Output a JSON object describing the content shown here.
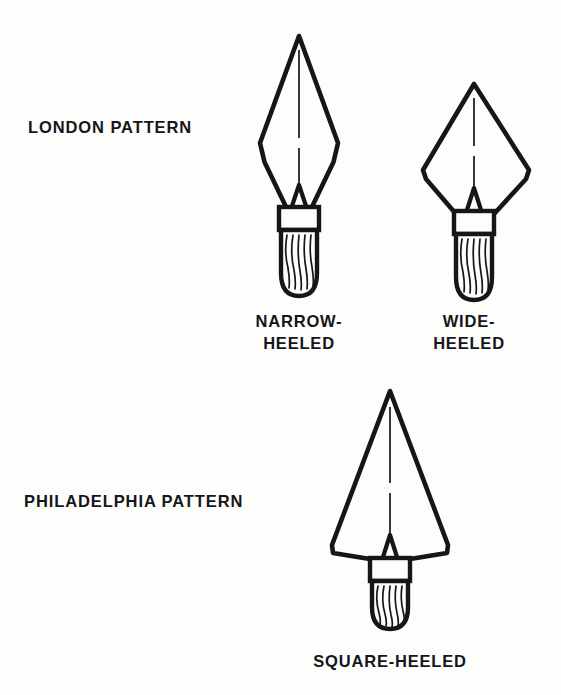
{
  "figure": {
    "background_color": "#fdfdfb",
    "ink_color": "#16161a",
    "width": 561,
    "height": 695
  },
  "groups": [
    {
      "id": "london",
      "label": "LONDON PATTERN"
    },
    {
      "id": "philadelphia",
      "label": "PHILADELPHIA PATTERN"
    }
  ],
  "labels": {
    "london_pattern": "LONDON PATTERN",
    "philadelphia_pattern": "PHILADELPHIA PATTERN"
  },
  "captions": {
    "narrow_heeled_line1": "NARROW-",
    "narrow_heeled_line2": "HEELED",
    "wide_heeled_line1": "WIDE-",
    "wide_heeled_line2": "HEELED",
    "square_heeled": "SQUARE-HEELED"
  },
  "trowels": [
    {
      "id": "narrow-heeled",
      "group": "london",
      "caption": "NARROW-HEELED",
      "blade_shape": "kite",
      "heel": "narrow",
      "widest_point_fraction": 0.58,
      "parts": [
        "blade",
        "center-ridge",
        "tang",
        "ferrule",
        "wood-handle"
      ],
      "handle_grain_lines": 6
    },
    {
      "id": "wide-heeled",
      "group": "london",
      "caption": "WIDE-HEELED",
      "blade_shape": "kite",
      "heel": "wide",
      "widest_point_fraction": 0.68,
      "parts": [
        "blade",
        "center-ridge",
        "tang",
        "ferrule",
        "wood-handle"
      ],
      "handle_grain_lines": 6
    },
    {
      "id": "square-heeled",
      "group": "philadelphia",
      "caption": "SQUARE-HEELED",
      "blade_shape": "triangle",
      "heel": "square",
      "widest_point_fraction": 1.0,
      "parts": [
        "blade",
        "center-ridge",
        "tang",
        "ferrule",
        "wood-handle"
      ],
      "handle_grain_lines": 6
    }
  ]
}
